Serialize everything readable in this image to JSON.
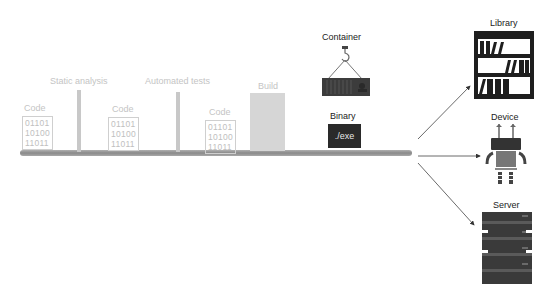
{
  "stages": {
    "code1": {
      "label": "Code",
      "lines": [
        "01101",
        "10100",
        "11011"
      ]
    },
    "static_analysis": {
      "label": "Static analysis"
    },
    "code2": {
      "label": "Code",
      "lines": [
        "01101",
        "10100",
        "11011"
      ]
    },
    "automated_tests": {
      "label": "Automated tests"
    },
    "code3": {
      "label": "Code",
      "lines": [
        "01101",
        "10100",
        "11011"
      ]
    },
    "build": {
      "label": "Build"
    },
    "container": {
      "label": "Container"
    },
    "binary": {
      "label": "Binary",
      "content": "./exe"
    }
  },
  "targets": {
    "library": {
      "label": "Library"
    },
    "device": {
      "label": "Device"
    },
    "server": {
      "label": "Server"
    }
  },
  "colors": {
    "pipe": "#9a9a9a",
    "faint_text": "#c4c4c4",
    "dark": "#2a2a2a",
    "container": "#3a3a3a"
  }
}
